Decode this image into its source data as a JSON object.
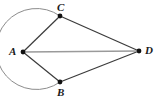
{
  "figure": {
    "background_color": "#ffffff",
    "width": 161,
    "height": 104,
    "vertices": [
      {
        "id": "A",
        "label": "A",
        "x": 23,
        "y": 52,
        "label_x": 9,
        "label_y": 46,
        "dot_color": "#111111"
      },
      {
        "id": "B",
        "label": "B",
        "x": 60,
        "y": 82,
        "label_x": 57,
        "label_y": 87,
        "dot_color": "#111111"
      },
      {
        "id": "C",
        "label": "C",
        "x": 60,
        "y": 16,
        "label_x": 57,
        "label_y": 2,
        "dot_color": "#111111"
      },
      {
        "id": "D",
        "label": "D",
        "x": 139,
        "y": 51,
        "label_x": 145,
        "label_y": 45,
        "dot_color": "#111111"
      }
    ],
    "arc": {
      "id": "arc-CAB",
      "description": "circular arc from C through A to B",
      "center_x": 60,
      "center_y": 49,
      "radius": 40.5,
      "start_x": 60,
      "start_y": 16,
      "end_x": 60,
      "end_y": 82,
      "sweep": "counterclockwise-left",
      "stroke": "#8c8c8c",
      "stroke_width": 1
    },
    "segments": [
      {
        "id": "AC",
        "from": "A",
        "to": "C",
        "x1": 23,
        "y1": 52,
        "x2": 60,
        "y2": 16,
        "stroke": "#3b3b3b",
        "stroke_width": 1.2
      },
      {
        "id": "AB",
        "from": "A",
        "to": "B",
        "x1": 23,
        "y1": 52,
        "x2": 60,
        "y2": 82,
        "stroke": "#3b3b3b",
        "stroke_width": 1.2
      },
      {
        "id": "AD",
        "from": "A",
        "to": "D",
        "x1": 23,
        "y1": 52,
        "x2": 139,
        "y2": 51,
        "stroke": "#9a9a9a",
        "stroke_width": 1.4
      },
      {
        "id": "CD",
        "from": "C",
        "to": "D",
        "x1": 60,
        "y1": 16,
        "x2": 139,
        "y2": 51,
        "stroke": "#3b3b3b",
        "stroke_width": 1.2
      },
      {
        "id": "BD",
        "from": "B",
        "to": "D",
        "x1": 60,
        "y1": 82,
        "x2": 139,
        "y2": 51,
        "stroke": "#3b3b3b",
        "stroke_width": 1.2
      }
    ],
    "dot_radius": 2.4
  },
  "chart_data": {
    "type": "diagram",
    "points": {
      "A": [
        23,
        52
      ],
      "B": [
        60,
        82
      ],
      "C": [
        60,
        16
      ],
      "D": [
        139,
        51
      ]
    },
    "edges": [
      "A-C",
      "A-B",
      "A-D",
      "C-D",
      "B-D"
    ],
    "arcs": [
      "C-A-B"
    ],
    "labels": [
      "A",
      "B",
      "C",
      "D"
    ]
  }
}
